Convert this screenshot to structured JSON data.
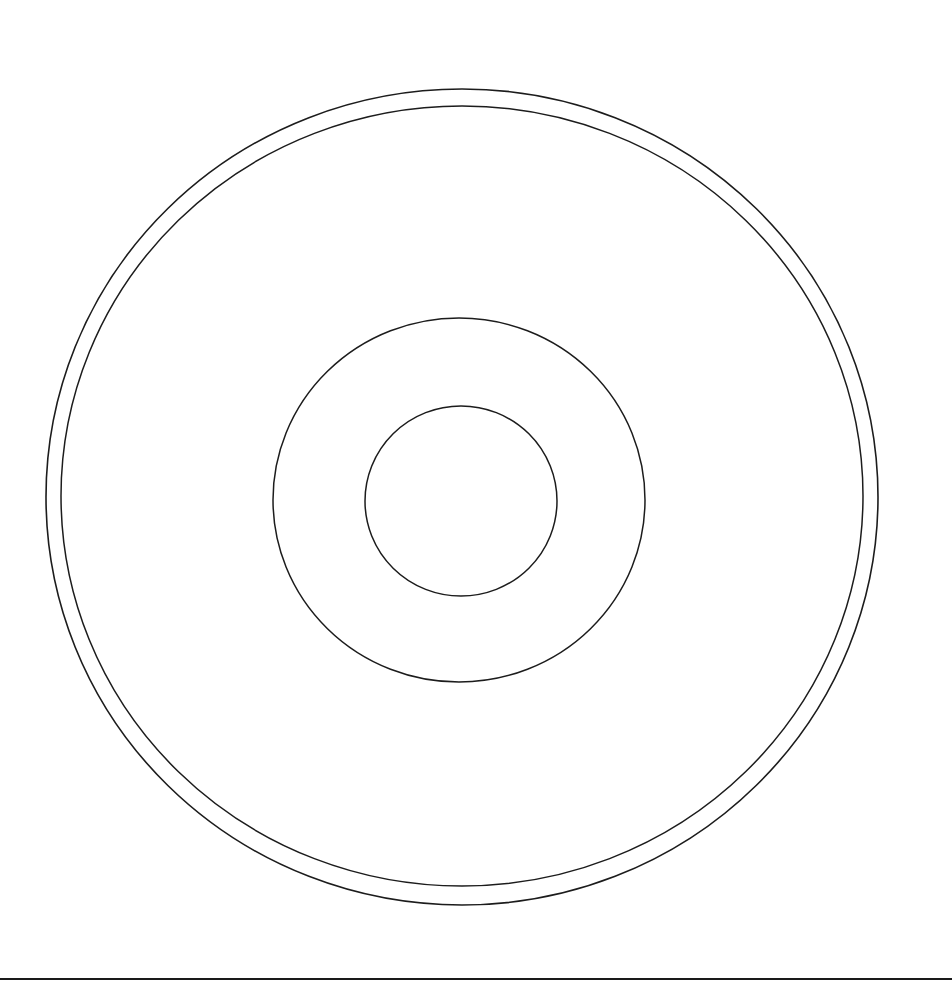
{
  "canvas": {
    "width": 952,
    "height": 993,
    "background_color": "#ffffff",
    "stroke_color": "#1c1c1c",
    "description": "Monochrome technical line drawing: plan view of a disc composed of four concentric circles over a horizontal ground line"
  },
  "figure": {
    "kind": "line-drawing",
    "element_count": 5
  },
  "shapes": [
    {
      "id": "outer-rim-circle",
      "name": "outer-rim-circle",
      "type": "ellipse",
      "cx": 462,
      "cy": 497,
      "rx": 416,
      "ry": 408,
      "stroke": "#1c1c1c",
      "stroke_width": 1.6,
      "fill": "none",
      "role": "outermost disc edge"
    },
    {
      "id": "inner-rim-circle",
      "name": "inner-rim-circle",
      "type": "ellipse",
      "cx": 462,
      "cy": 496,
      "rx": 401,
      "ry": 390,
      "stroke": "#1c1c1c",
      "stroke_width": 1.5,
      "fill": "none",
      "role": "second rim line forming a narrow annular band with the outer edge"
    },
    {
      "id": "mid-hub-circle",
      "name": "mid-hub-circle",
      "type": "ellipse",
      "cx": 459,
      "cy": 500,
      "rx": 186,
      "ry": 182,
      "stroke": "#1c1c1c",
      "stroke_width": 1.5,
      "fill": "none",
      "role": "clamping / hub ring"
    },
    {
      "id": "center-hole-circle",
      "name": "center-hole-circle",
      "type": "ellipse",
      "cx": 461,
      "cy": 501,
      "rx": 96,
      "ry": 95,
      "stroke": "#1c1c1c",
      "stroke_width": 1.5,
      "fill": "none",
      "role": "central spindle hole"
    },
    {
      "id": "ground-baseline",
      "name": "ground-baseline",
      "type": "line",
      "x1": 0,
      "y1": 979,
      "x2": 952,
      "y2": 979,
      "stroke": "#1a1a1a",
      "stroke_width": 2.2,
      "role": "horizontal datum / ground line at the bottom of the sheet"
    }
  ],
  "annotations": {
    "labels": [],
    "dimensions": [],
    "note": "No text, callouts, dimensions, or legend are present in the drawing"
  }
}
